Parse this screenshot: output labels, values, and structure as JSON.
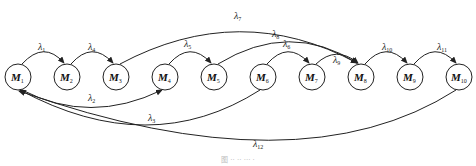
{
  "diagram": {
    "nodes": [
      {
        "id": "M1",
        "base": "M",
        "sub": "1",
        "cx": 18,
        "cy": 77
      },
      {
        "id": "M2",
        "base": "M",
        "sub": "2",
        "cx": 67,
        "cy": 77
      },
      {
        "id": "M3",
        "base": "M",
        "sub": "3",
        "cx": 116,
        "cy": 77
      },
      {
        "id": "M4",
        "base": "M",
        "sub": "4",
        "cx": 165,
        "cy": 77
      },
      {
        "id": "M5",
        "base": "M",
        "sub": "5",
        "cx": 214,
        "cy": 77
      },
      {
        "id": "M6",
        "base": "M",
        "sub": "6",
        "cx": 263,
        "cy": 77
      },
      {
        "id": "M7",
        "base": "M",
        "sub": "7",
        "cx": 312,
        "cy": 77
      },
      {
        "id": "M8",
        "base": "M",
        "sub": "8",
        "cx": 361,
        "cy": 77
      },
      {
        "id": "M9",
        "base": "M",
        "sub": "9",
        "cx": 410,
        "cy": 77
      },
      {
        "id": "M10",
        "base": "M",
        "sub": "10",
        "cx": 459,
        "cy": 77
      }
    ],
    "edges": [
      {
        "label": "λ",
        "sub": "1",
        "from": "M1",
        "to": "M2"
      },
      {
        "label": "λ",
        "sub": "4",
        "from": "M2",
        "to": "M3"
      },
      {
        "label": "λ",
        "sub": "7",
        "from": "M3",
        "to": "M8"
      },
      {
        "label": "λ",
        "sub": "5",
        "from": "M4",
        "to": "M5"
      },
      {
        "label": "λ",
        "sub": "8",
        "from": "M5",
        "to": "M8"
      },
      {
        "label": "λ",
        "sub": "6",
        "from": "M6",
        "to": "M7"
      },
      {
        "label": "λ",
        "sub": "9",
        "from": "M7",
        "to": "M8"
      },
      {
        "label": "λ",
        "sub": "10",
        "from": "M8",
        "to": "M9"
      },
      {
        "label": "λ",
        "sub": "11",
        "from": "M9",
        "to": "M10"
      },
      {
        "label": "λ",
        "sub": "2",
        "from": "M1",
        "to": "M4"
      },
      {
        "label": "λ",
        "sub": "3",
        "from": "M6",
        "to": "M1"
      },
      {
        "label": "λ",
        "sub": "12",
        "from": "M10",
        "to": "M1"
      }
    ]
  },
  "caption": "图 ·· ·· ··· ·"
}
